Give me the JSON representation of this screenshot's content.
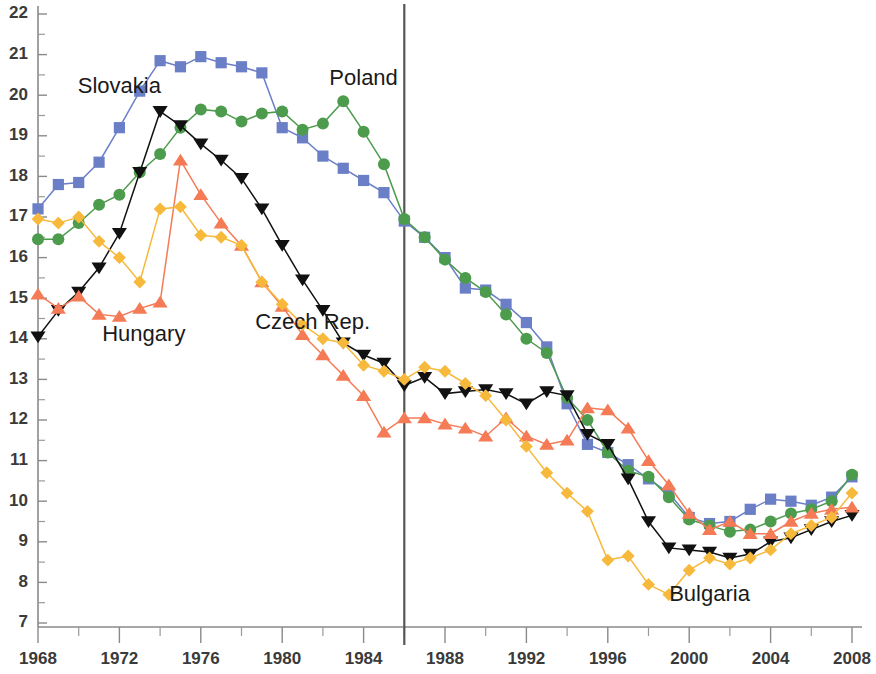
{
  "chart_data": {
    "type": "line",
    "title": "",
    "subtitle": "",
    "xlabel": "",
    "ylabel": "",
    "xlim": [
      1968,
      2008
    ],
    "ylim": [
      7,
      22
    ],
    "y_ticks": [
      7,
      8,
      9,
      10,
      11,
      12,
      13,
      14,
      15,
      16,
      17,
      18,
      19,
      20,
      21,
      22
    ],
    "y_minor_step": 0.5,
    "x_ticks": [
      1968,
      1972,
      1976,
      1980,
      1984,
      1988,
      1992,
      1996,
      2000,
      2004,
      2008
    ],
    "x_minor_step": 2,
    "grid": false,
    "legend": "inline-labels",
    "annotations": [
      {
        "name": "reference-line-1986",
        "type": "vline",
        "x": 1986
      }
    ],
    "x": [
      1968,
      1969,
      1970,
      1971,
      1972,
      1973,
      1974,
      1975,
      1976,
      1977,
      1978,
      1979,
      1980,
      1981,
      1982,
      1983,
      1984,
      1985,
      1986,
      1987,
      1988,
      1989,
      1990,
      1991,
      1992,
      1993,
      1994,
      1995,
      1996,
      1997,
      1998,
      1999,
      2000,
      2001,
      2002,
      2003,
      2004,
      2005,
      2006,
      2007,
      2008
    ],
    "series": [
      {
        "name": "Slovakia",
        "color": "#6b7fc7",
        "marker": "square",
        "label_x": 1972.0,
        "label_y": 20.05,
        "values": [
          17.2,
          17.8,
          17.85,
          18.35,
          19.2,
          20.1,
          20.85,
          20.7,
          20.95,
          20.8,
          20.7,
          20.55,
          19.2,
          18.95,
          18.5,
          18.2,
          17.9,
          17.6,
          16.9,
          16.5,
          16.0,
          15.25,
          15.2,
          14.85,
          14.4,
          13.8,
          12.4,
          11.4,
          11.2,
          10.9,
          10.55,
          10.2,
          9.6,
          9.45,
          9.5,
          9.8,
          10.05,
          10.0,
          9.9,
          10.1,
          10.6
        ]
      },
      {
        "name": "Poland",
        "color": "#4d9b4d",
        "marker": "circle",
        "label_x": 1984.0,
        "label_y": 20.25,
        "values": [
          16.45,
          16.45,
          16.85,
          17.3,
          17.55,
          18.1,
          18.55,
          19.2,
          19.65,
          19.6,
          19.35,
          19.55,
          19.6,
          19.15,
          19.3,
          19.85,
          19.1,
          18.3,
          16.95,
          16.5,
          15.95,
          15.5,
          15.15,
          14.6,
          14.0,
          13.65,
          12.55,
          12.0,
          11.2,
          10.75,
          10.6,
          10.1,
          9.55,
          9.4,
          9.25,
          9.3,
          9.5,
          9.7,
          9.8,
          10.0,
          10.65
        ]
      },
      {
        "name": "Czech Rep.",
        "color": "#111111",
        "marker": "triangle-down",
        "label_x": 1981.5,
        "label_y": 14.25,
        "values": [
          14.05,
          14.7,
          15.15,
          15.75,
          16.6,
          18.1,
          19.6,
          19.25,
          18.8,
          18.4,
          17.95,
          17.2,
          16.3,
          15.45,
          14.7,
          13.9,
          13.6,
          13.4,
          12.85,
          13.05,
          12.65,
          12.7,
          12.75,
          12.65,
          12.4,
          12.7,
          12.6,
          11.65,
          11.4,
          10.55,
          9.5,
          8.85,
          8.8,
          8.75,
          8.6,
          8.7,
          9.0,
          9.1,
          9.3,
          9.5,
          9.65
        ]
      },
      {
        "name": "Hungary",
        "color": "#f47b55",
        "marker": "triangle-up",
        "label_x": 1973.2,
        "label_y": 13.95,
        "values": [
          15.1,
          14.75,
          15.05,
          14.6,
          14.55,
          14.75,
          14.9,
          18.4,
          17.55,
          16.85,
          16.3,
          15.4,
          14.8,
          14.1,
          13.6,
          13.1,
          12.6,
          11.7,
          12.05,
          12.05,
          11.9,
          11.8,
          11.6,
          12.05,
          11.6,
          11.4,
          11.5,
          12.3,
          12.25,
          11.8,
          11.0,
          10.4,
          9.7,
          9.3,
          9.5,
          9.2,
          9.2,
          9.5,
          9.7,
          9.8,
          9.85
        ]
      },
      {
        "name": "Bulgaria",
        "color": "#f6b93b",
        "marker": "diamond",
        "label_x": 2001.0,
        "label_y": 7.55,
        "values": [
          16.95,
          16.85,
          17.0,
          16.4,
          16.0,
          15.4,
          17.2,
          17.25,
          16.55,
          16.5,
          16.3,
          15.4,
          14.85,
          14.35,
          14.0,
          13.9,
          13.35,
          13.2,
          13.0,
          13.3,
          13.2,
          12.9,
          12.6,
          12.0,
          11.35,
          10.7,
          10.2,
          9.75,
          8.55,
          8.65,
          7.95,
          7.7,
          8.3,
          8.6,
          8.45,
          8.6,
          8.8,
          9.2,
          9.4,
          9.6,
          10.2
        ]
      }
    ]
  },
  "labels": {
    "slovakia": "Slovakia",
    "poland": "Poland",
    "czech": "Czech  Rep.",
    "hungary": "Hungary",
    "bulgaria": "Bulgaria"
  }
}
